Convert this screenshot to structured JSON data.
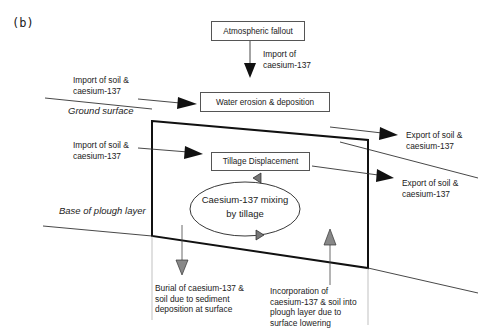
{
  "panel_label": "(b)",
  "boxes": {
    "atmospheric": "Atmospheric fallout",
    "water": "Water erosion & deposition",
    "tillage": "Tillage Displacement"
  },
  "labels": {
    "import_cs": "Import of\ncaesium-137",
    "import_top": "Import of soil &\ncaesium-137",
    "import_mid": "Import of soil &\ncaesium-137",
    "export_top": "Export of soil &\ncaesium-137",
    "export_mid": "Export of soil &\ncaesium-137",
    "ground_surface": "Ground surface",
    "base_plough": "Base of plough layer",
    "burial": "Burial of caesium-137 &\nsoil due to sediment\ndeposition at surface",
    "incorporation": "Incorporation of\ncaesium-137 & soil into\nplough layer due to\nsurface lowering"
  },
  "mixing": {
    "line1": "Caesium-137 mixing",
    "line2": "by tillage"
  }
}
